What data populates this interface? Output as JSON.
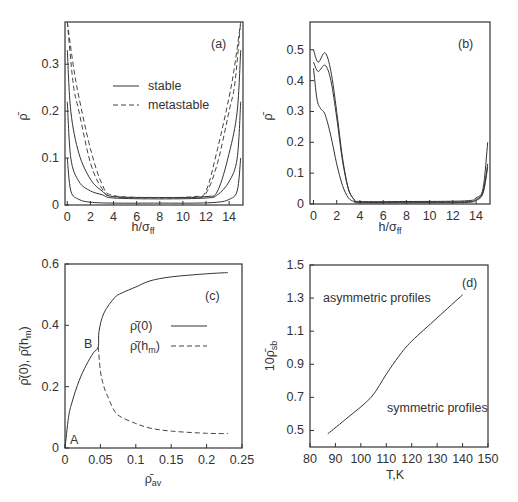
{
  "figure": {
    "panels": [
      "(a)",
      "(b)",
      "(c)",
      "(d)"
    ]
  },
  "chart_data": [
    {
      "id": "a",
      "type": "line",
      "panel_label": "(a)",
      "xlabel": "h/σ_ff",
      "ylabel": "ρ̄",
      "xticks": [
        "0",
        "2",
        "4",
        "6",
        "8",
        "10",
        "12",
        "14"
      ],
      "yticks": [
        "0",
        "0.1",
        "0.2",
        "0.3"
      ],
      "xlim": [
        -0.2,
        15.2
      ],
      "ylim": [
        0,
        0.39
      ],
      "legend": [
        {
          "name": "stable",
          "style": "solid"
        },
        {
          "name": "metastable",
          "style": "dashed"
        }
      ],
      "legend_position": "upper center",
      "series": [
        {
          "name": "stable-1",
          "style": "solid",
          "x": [
            0,
            0.3,
            1,
            2,
            4,
            8,
            11,
            13,
            14,
            14.7,
            15
          ],
          "y": [
            0.1,
            0.03,
            0.012,
            0.006,
            0.004,
            0.004,
            0.004,
            0.006,
            0.012,
            0.03,
            0.1
          ]
        },
        {
          "name": "stable-2",
          "style": "solid",
          "x": [
            0,
            0.3,
            1,
            2,
            3,
            4,
            8,
            12,
            13,
            14,
            14.7,
            15
          ],
          "y": [
            0.22,
            0.1,
            0.05,
            0.03,
            0.022,
            0.015,
            0.013,
            0.015,
            0.022,
            0.05,
            0.1,
            0.22
          ]
        },
        {
          "name": "stable-3",
          "style": "solid",
          "x": [
            0,
            0.3,
            1,
            2,
            3,
            4,
            8,
            12,
            13,
            14,
            14.7,
            15
          ],
          "y": [
            0.33,
            0.2,
            0.11,
            0.055,
            0.03,
            0.018,
            0.016,
            0.018,
            0.03,
            0.11,
            0.2,
            0.33
          ]
        },
        {
          "name": "metastable-1",
          "style": "dashed",
          "x": [
            0,
            0.5,
            1,
            2,
            3,
            4,
            8,
            11,
            12,
            13,
            14,
            14.5,
            15
          ],
          "y": [
            0.39,
            0.26,
            0.2,
            0.09,
            0.035,
            0.018,
            0.015,
            0.016,
            0.025,
            0.09,
            0.2,
            0.26,
            0.39
          ]
        },
        {
          "name": "metastable-2",
          "style": "dashed",
          "x": [
            0,
            0.5,
            1,
            2,
            3,
            4,
            8,
            11,
            12,
            13,
            14,
            14.5,
            15
          ],
          "y": [
            0.39,
            0.3,
            0.23,
            0.12,
            0.045,
            0.02,
            0.016,
            0.018,
            0.03,
            0.12,
            0.23,
            0.3,
            0.39
          ]
        }
      ]
    },
    {
      "id": "b",
      "type": "line",
      "panel_label": "(b)",
      "xlabel": "h/σ_ff",
      "ylabel": "ρ̄",
      "xticks": [
        "0",
        "2",
        "4",
        "6",
        "8",
        "10",
        "12",
        "14"
      ],
      "yticks": [
        "0",
        "0.1",
        "0.2",
        "0.3",
        "0.4",
        "0.5"
      ],
      "xlim": [
        -0.3,
        15.2
      ],
      "ylim": [
        0,
        0.59
      ],
      "series": [
        {
          "name": "profile-1",
          "style": "solid",
          "x": [
            0,
            0.4,
            1,
            1.5,
            2,
            2.5,
            3,
            3.5,
            4,
            8,
            13,
            14,
            14.6,
            15
          ],
          "y": [
            0.5,
            0.46,
            0.49,
            0.43,
            0.3,
            0.15,
            0.05,
            0.015,
            0.008,
            0.008,
            0.01,
            0.02,
            0.05,
            0.2
          ]
        },
        {
          "name": "profile-2",
          "style": "solid",
          "x": [
            0,
            0.4,
            1,
            1.5,
            2,
            2.5,
            3,
            3.5,
            4,
            8,
            13,
            14,
            14.6,
            15
          ],
          "y": [
            0.46,
            0.43,
            0.45,
            0.4,
            0.28,
            0.14,
            0.05,
            0.015,
            0.006,
            0.006,
            0.007,
            0.015,
            0.04,
            0.13
          ]
        },
        {
          "name": "profile-3",
          "style": "solid",
          "x": [
            0,
            0.3,
            0.6,
            1,
            1.5,
            2,
            2.5,
            3,
            3.5,
            4,
            8,
            13,
            14,
            14.6,
            15
          ],
          "y": [
            0.44,
            0.34,
            0.31,
            0.29,
            0.22,
            0.13,
            0.06,
            0.02,
            0.008,
            0.004,
            0.004,
            0.005,
            0.012,
            0.035,
            0.12
          ]
        }
      ]
    },
    {
      "id": "c",
      "type": "line",
      "panel_label": "(c)",
      "xlabel": "ρ̄_av",
      "ylabel": "ρ̄(0), ρ̄(h_m)",
      "xticks": [
        "0",
        "0.05",
        "0.1",
        "0.15",
        "0.2",
        "0.25"
      ],
      "yticks": [
        "0",
        "0.2",
        "0.4",
        "0.6"
      ],
      "xlim": [
        0,
        0.25
      ],
      "ylim": [
        0,
        0.6
      ],
      "legend": [
        {
          "name": "ρ̄(0)",
          "style": "solid"
        },
        {
          "name": "ρ̄(h_m)",
          "style": "dashed"
        }
      ],
      "annotations": [
        {
          "text": "A",
          "x": 0.004,
          "y": 0.03
        },
        {
          "text": "B",
          "x": 0.04,
          "y": 0.34
        }
      ],
      "series": [
        {
          "name": "ρ̄(0)",
          "style": "solid",
          "x": [
            0,
            0.005,
            0.01,
            0.02,
            0.03,
            0.04,
            0.047,
            0.048,
            0.055,
            0.07,
            0.08,
            0.1,
            0.12,
            0.15,
            0.2,
            0.23
          ],
          "y": [
            0,
            0.1,
            0.15,
            0.22,
            0.27,
            0.31,
            0.33,
            0.38,
            0.44,
            0.49,
            0.505,
            0.525,
            0.545,
            0.558,
            0.568,
            0.572
          ]
        },
        {
          "name": "ρ̄(h_m)",
          "style": "dashed",
          "x": [
            0.047,
            0.05,
            0.055,
            0.06,
            0.07,
            0.08,
            0.1,
            0.12,
            0.15,
            0.2,
            0.23
          ],
          "y": [
            0.33,
            0.25,
            0.2,
            0.17,
            0.12,
            0.1,
            0.08,
            0.065,
            0.055,
            0.048,
            0.047
          ]
        }
      ]
    },
    {
      "id": "d",
      "type": "line",
      "panel_label": "(d)",
      "xlabel": "T,K",
      "ylabel": "10ρ̄_sb",
      "xticks": [
        "80",
        "90",
        "100",
        "110",
        "120",
        "130",
        "140",
        "150"
      ],
      "yticks": [
        "0.5",
        "0.7",
        "0.9",
        "1.1",
        "1.3",
        "1.5"
      ],
      "xlim": [
        80,
        150
      ],
      "ylim": [
        0.4,
        1.5
      ],
      "annotations": [
        {
          "text": "asymmetric profiles",
          "x": 85,
          "y": 1.3
        },
        {
          "text": "symmetric profiles",
          "x": 110,
          "y": 0.65
        }
      ],
      "series": [
        {
          "name": "boundary",
          "style": "solid",
          "x": [
            87,
            95,
            104,
            110,
            115,
            120,
            130,
            140
          ],
          "y": [
            0.48,
            0.58,
            0.7,
            0.84,
            0.95,
            1.04,
            1.18,
            1.32
          ]
        }
      ]
    }
  ]
}
